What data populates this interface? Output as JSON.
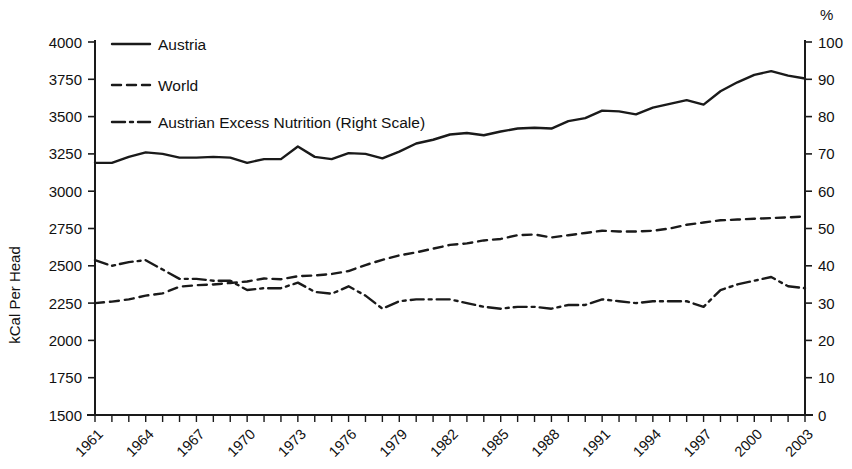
{
  "chart_data": {
    "type": "line",
    "title": "",
    "subtitle": "",
    "xlabel": "",
    "ylabel": "kCal Per Head",
    "y2label": "%",
    "xlim": [
      1961,
      2003
    ],
    "ylim": [
      1500,
      4000
    ],
    "y2lim": [
      0,
      100
    ],
    "grid": false,
    "legend_position": "top-left",
    "x_tick_labels": [
      "1961",
      "1964",
      "1967",
      "1970",
      "1973",
      "1976",
      "1979",
      "1982",
      "1985",
      "1988",
      "1991",
      "1994",
      "1997",
      "2000",
      "2003"
    ],
    "y_tick_labels": [
      "1500",
      "1750",
      "2000",
      "2250",
      "2500",
      "2750",
      "3000",
      "3250",
      "3500",
      "3750",
      "4000"
    ],
    "y2_tick_labels": [
      "0",
      "10",
      "20",
      "30",
      "40",
      "50",
      "60",
      "70",
      "80",
      "90",
      "100"
    ],
    "y_ticks": [
      1500,
      1750,
      2000,
      2250,
      2500,
      2750,
      3000,
      3250,
      3500,
      3750,
      4000
    ],
    "y2_ticks": [
      0,
      10,
      20,
      30,
      40,
      50,
      60,
      70,
      80,
      90,
      100
    ],
    "x": [
      1961,
      1962,
      1963,
      1964,
      1965,
      1966,
      1967,
      1968,
      1969,
      1970,
      1971,
      1972,
      1973,
      1974,
      1975,
      1976,
      1977,
      1978,
      1979,
      1980,
      1981,
      1982,
      1983,
      1984,
      1985,
      1986,
      1987,
      1988,
      1989,
      1990,
      1991,
      1992,
      1993,
      1994,
      1995,
      1996,
      1997,
      1998,
      1999,
      2000,
      2001,
      2002,
      2003
    ],
    "series": [
      {
        "name": "Austria",
        "style": "solid",
        "axis": "left",
        "units": "kCal Per Head",
        "values": [
          3190,
          3190,
          3230,
          3260,
          3250,
          3225,
          3225,
          3230,
          3225,
          3190,
          3215,
          3215,
          3300,
          3230,
          3215,
          3255,
          3250,
          3220,
          3265,
          3320,
          3345,
          3380,
          3390,
          3375,
          3400,
          3420,
          3425,
          3420,
          3470,
          3490,
          3540,
          3535,
          3515,
          3560,
          3585,
          3610,
          3580,
          3670,
          3730,
          3780,
          3805,
          3775,
          3755
        ]
      },
      {
        "name": "World",
        "style": "dashed",
        "axis": "left",
        "units": "kCal Per Head",
        "values": [
          2250,
          2260,
          2275,
          2300,
          2315,
          2360,
          2370,
          2375,
          2385,
          2395,
          2415,
          2410,
          2430,
          2435,
          2445,
          2465,
          2505,
          2540,
          2570,
          2590,
          2615,
          2640,
          2650,
          2670,
          2680,
          2705,
          2710,
          2690,
          2705,
          2720,
          2735,
          2730,
          2730,
          2735,
          2750,
          2775,
          2790,
          2805,
          2810,
          2815,
          2820,
          2825,
          2830
        ]
      },
      {
        "name": "Austrian Excess Nutrition (Right Scale)",
        "style": "dashdot",
        "axis": "right",
        "units": "%",
        "values": [
          41.5,
          40.0,
          41.0,
          41.5,
          39.0,
          36.5,
          36.5,
          36.0,
          36.0,
          33.5,
          34.0,
          34.0,
          35.5,
          33.0,
          32.5,
          34.5,
          32.0,
          28.5,
          30.5,
          31.0,
          31.0,
          31.0,
          30.0,
          29.0,
          28.5,
          29.0,
          29.0,
          28.5,
          29.5,
          29.5,
          31.0,
          30.5,
          30.0,
          30.5,
          30.5,
          30.5,
          29.0,
          33.5,
          35.0,
          36.0,
          37.0,
          34.5,
          34.0
        ]
      }
    ]
  },
  "legend": {
    "items": [
      {
        "label": "Austria",
        "style": "solid"
      },
      {
        "label": "World",
        "style": "dashed"
      },
      {
        "label": "Austrian Excess Nutrition (Right Scale)",
        "style": "dashdot"
      }
    ]
  },
  "axes": {
    "left_title": "kCal Per Head",
    "right_title": "%"
  },
  "colors": {
    "line": "#1a1a1a",
    "text": "#111111",
    "background": "#ffffff"
  }
}
